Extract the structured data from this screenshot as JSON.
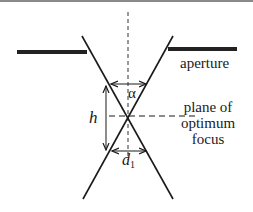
{
  "diagram": {
    "type": "optical focus geometry",
    "labels": {
      "aperture": "aperture",
      "plane_line1": "plane of",
      "plane_line2": "optimum",
      "plane_line3": "focus",
      "height": "h",
      "angle": "α",
      "diameter_symbol": "d",
      "diameter_subscript": "1"
    },
    "colors": {
      "line": "#1a1a1a",
      "aperture_bar": "#222222",
      "background": "#ffffff"
    },
    "geometry": {
      "optical_axis_x": 128,
      "focus_point": [
        128,
        116
      ],
      "ray_left": [
        [
          82,
          36
        ],
        [
          173,
          199
        ]
      ],
      "ray_right": [
        [
          173,
          36
        ],
        [
          83,
          199
        ]
      ],
      "aperture_left": [
        [
          17,
          52
        ],
        [
          87,
          52
        ]
      ],
      "aperture_right": [
        [
          168,
          49
        ],
        [
          237,
          49
        ]
      ],
      "alpha_arrow_y": 84,
      "d1_arrow_y": 151,
      "h_arrow_x": 106,
      "h_arrow_range": [
        86,
        150
      ]
    }
  }
}
